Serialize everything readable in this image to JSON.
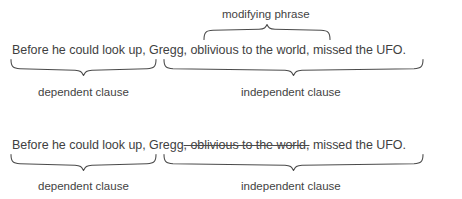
{
  "figure": {
    "type": "grammar-annotation-diagram",
    "background_color": "#ffffff",
    "text_color": "#3f3f3f",
    "brace_color": "#4b4b4b"
  },
  "examples": [
    {
      "id": "example-1",
      "sentence": {
        "dependent_clause": "Before he could look up,",
        "independent_clause_before_modifier": " Gregg,",
        "modifying_phrase": " oblivious to the world,",
        "independent_clause_after_modifier": " missed the UFO.",
        "struck_through": false
      },
      "labels": {
        "modifying_phrase": "modifying phrase",
        "dependent_clause": "dependent clause",
        "independent_clause": "independent clause"
      },
      "braces": {
        "modifying_phrase": "brace-up",
        "dependent_clause": "brace-down",
        "independent_clause": "brace-down"
      }
    },
    {
      "id": "example-2",
      "sentence": {
        "dependent_clause": "Before he could look up,",
        "independent_clause_before_modifier": " Gregg",
        "modifying_phrase": ", oblivious to the world,",
        "independent_clause_after_modifier": " missed the UFO.",
        "struck_through": true
      },
      "labels": {
        "dependent_clause": "dependent clause",
        "independent_clause": "independent clause"
      },
      "braces": {
        "dependent_clause": "brace-down",
        "independent_clause": "brace-down"
      }
    }
  ]
}
